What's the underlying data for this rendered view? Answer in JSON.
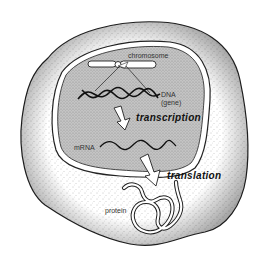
{
  "diagram": {
    "type": "cell-central-dogma",
    "labels": {
      "chromosome": "chromosome",
      "dna": "DNA",
      "gene": "(gene)",
      "transcription": "transcription",
      "mrna": "mRNA",
      "translation": "translation",
      "protein": "protein"
    },
    "colors": {
      "background": "#ffffff",
      "outline": "#222222",
      "cytoplasm_stipple": "#9a9a9a",
      "nucleus_fill": "#b8b8b8",
      "arrow_fill": "#ffffff"
    }
  }
}
